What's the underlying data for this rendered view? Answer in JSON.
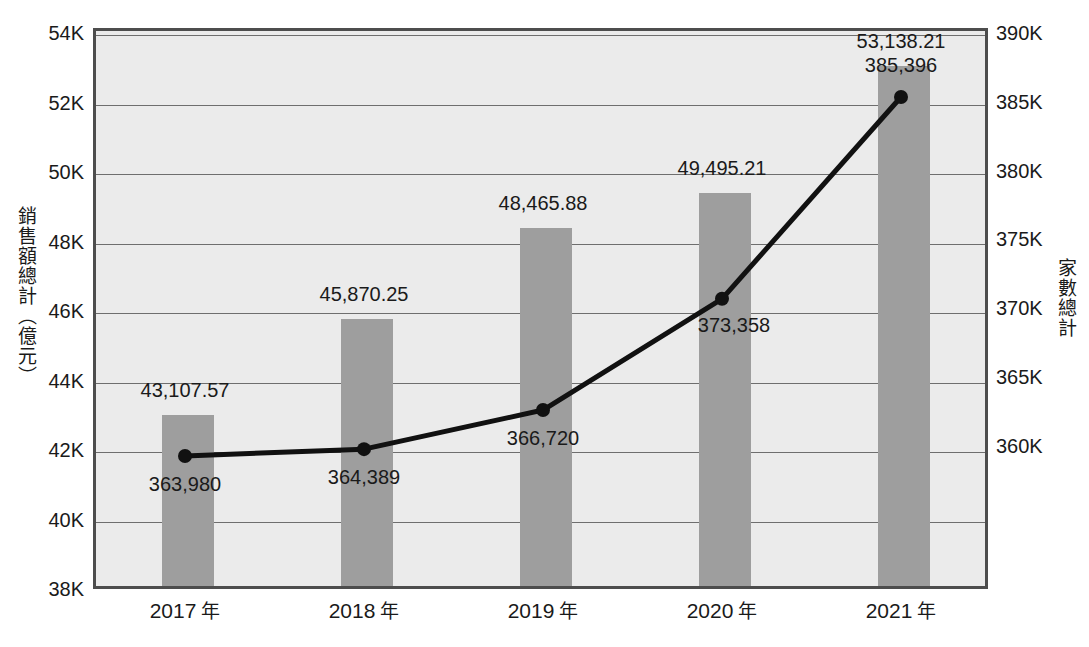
{
  "chart_data": {
    "type": "bar",
    "title": "",
    "categories": [
      "2017 年",
      "2018 年",
      "2019 年",
      "2020 年",
      "2021 年"
    ],
    "xlabel": "",
    "grid": true,
    "legend": "none",
    "series": [
      {
        "name": "銷售額總計（億元）",
        "type": "bar",
        "axis": "left",
        "color": "#9e9e9e",
        "values": [
          43107.57,
          45870.25,
          48465.88,
          49495.21,
          53138.21
        ],
        "labels": [
          "43,107.57",
          "45,870.25",
          "48,465.88",
          "49,495.21",
          "53,138.21"
        ]
      },
      {
        "name": "家數總計",
        "type": "line",
        "axis": "right",
        "color": "#111111",
        "values": [
          363980,
          364389,
          366720,
          373358,
          385396
        ],
        "labels": [
          "363,980",
          "364,389",
          "366,720",
          "373,358",
          "385,396"
        ]
      }
    ],
    "left_axis": {
      "label": "銷售額總計（億元）",
      "ticks": [
        "38K",
        "40K",
        "42K",
        "44K",
        "46K",
        "48K",
        "50K",
        "52K",
        "54K"
      ],
      "tick_values": [
        38000,
        40000,
        42000,
        44000,
        46000,
        48000,
        50000,
        52000,
        54000
      ],
      "ylim": [
        38000,
        54000
      ]
    },
    "right_axis": {
      "label": "家數總計",
      "ticks": [
        "360K",
        "365K",
        "370K",
        "375K",
        "380K",
        "385K",
        "390K"
      ],
      "tick_values": [
        360000,
        365000,
        370000,
        375000,
        380000,
        385000,
        390000
      ],
      "ylim": [
        356045,
        389214
      ]
    }
  },
  "colors": {
    "bar": "#9e9e9e",
    "line": "#111111",
    "plot_background": "#ebebeb",
    "frame": "#4d4d4d",
    "gridline": "#6e6e6e",
    "text": "#1a1a1a"
  },
  "caption": ""
}
